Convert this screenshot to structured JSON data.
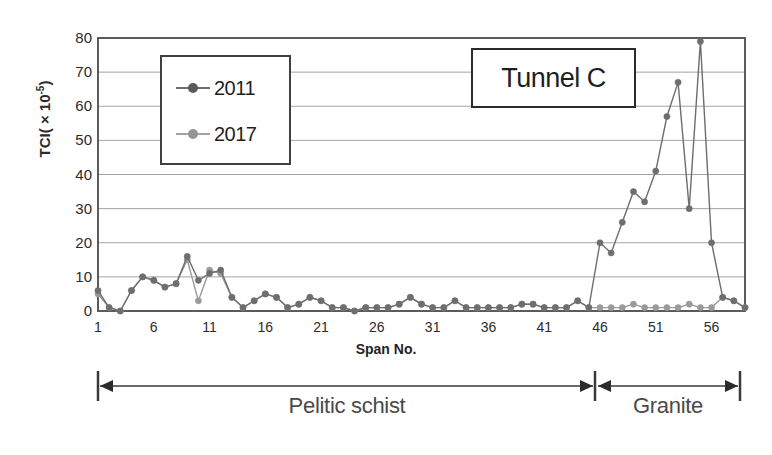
{
  "chart_data": {
    "type": "line",
    "title": "Tunnel C",
    "xlabel": "Span No.",
    "ylabel": "TCI( × 10-5)",
    "ylabel_prefix": "TCI( × 10",
    "ylabel_exp": "-5",
    "ylabel_suffix": ")",
    "xlim": [
      1,
      59
    ],
    "ylim": [
      0,
      80
    ],
    "yticks": [
      0,
      10,
      20,
      30,
      40,
      50,
      60,
      70,
      80
    ],
    "xticks": [
      1,
      6,
      11,
      16,
      21,
      26,
      31,
      36,
      41,
      46,
      51,
      56
    ],
    "grid": "horizontal",
    "legend_position": "upper-left-inside",
    "x": [
      1,
      2,
      3,
      4,
      5,
      6,
      7,
      8,
      9,
      10,
      11,
      12,
      13,
      14,
      15,
      16,
      17,
      18,
      19,
      20,
      21,
      22,
      23,
      24,
      25,
      26,
      27,
      28,
      29,
      30,
      31,
      32,
      33,
      34,
      35,
      36,
      37,
      38,
      39,
      40,
      41,
      42,
      43,
      44,
      45,
      46,
      47,
      48,
      49,
      50,
      51,
      52,
      53,
      54,
      55,
      56,
      57,
      58,
      59
    ],
    "series": [
      {
        "name": "2011",
        "color": "#6e6e6e",
        "marker": "circle",
        "values": [
          6,
          1,
          0,
          6,
          10,
          9,
          7,
          8,
          16,
          9,
          11,
          12,
          4,
          1,
          3,
          5,
          4,
          1,
          2,
          4,
          3,
          1,
          1,
          0,
          1,
          1,
          1,
          2,
          4,
          2,
          1,
          1,
          3,
          1,
          1,
          1,
          1,
          1,
          2,
          2,
          1,
          1,
          1,
          3,
          1,
          20,
          17,
          26,
          35,
          32,
          41,
          57,
          67,
          30,
          79,
          20,
          4,
          3,
          1
        ]
      },
      {
        "name": "2017",
        "color": "#9a9a9a",
        "marker": "circle",
        "values": [
          5,
          1,
          0,
          6,
          10,
          9,
          7,
          8,
          15,
          3,
          12,
          11,
          4,
          1,
          3,
          5,
          4,
          1,
          2,
          4,
          3,
          1,
          1,
          0,
          1,
          1,
          1,
          2,
          4,
          2,
          1,
          1,
          3,
          1,
          1,
          1,
          1,
          1,
          2,
          2,
          1,
          1,
          1,
          3,
          1,
          1,
          1,
          1,
          2,
          1,
          1,
          1,
          1,
          2,
          1,
          1,
          4,
          3,
          1
        ]
      }
    ],
    "annotations": [
      {
        "name": "pelitic-schist",
        "label": "Pelitic schist",
        "from_span": 1,
        "to_span": 45
      },
      {
        "name": "granite",
        "label": "Granite",
        "from_span": 45,
        "to_span": 59
      }
    ],
    "axis_colors": {
      "frame": "#4a4a4a",
      "grid": "#9a9a9a",
      "text": "#2b2b2b"
    }
  }
}
